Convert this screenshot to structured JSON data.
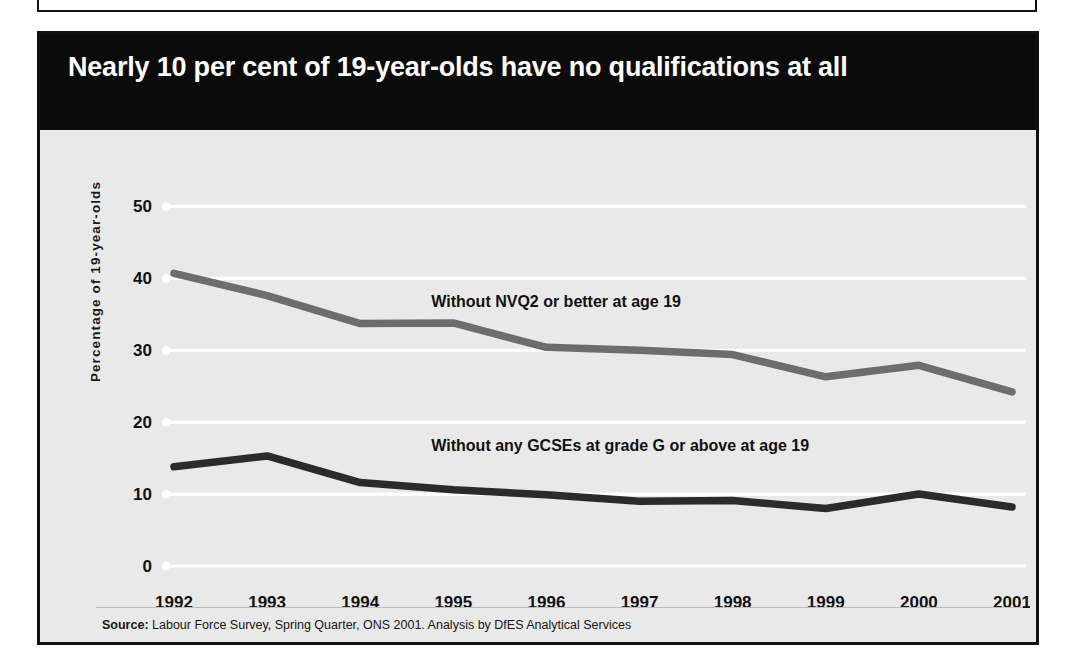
{
  "figure": {
    "title": "Nearly 10 per cent of 19-year-olds have no qualifications at all",
    "source_label": "Source:",
    "source_text": " Labour Force Survey, Spring Quarter, ONS 2001. Analysis by DfES Analytical Services",
    "colors": {
      "title_band": "#0b0b0b",
      "title_text": "#ffffff",
      "plot_background": "#e9e9e9",
      "gridline": "#ffffff",
      "series_nvq2": "#6d6d6d",
      "series_gcse": "#2b2b2b",
      "frame": "#111111"
    }
  },
  "chart_data": {
    "type": "line",
    "title": "Nearly 10 per cent of 19-year-olds have no qualifications at all",
    "xlabel": "",
    "ylabel": "Percentage of 19-year-olds",
    "x": [
      "1992",
      "1993",
      "1994",
      "1995",
      "1996",
      "1997",
      "1998",
      "1999",
      "2000",
      "2001"
    ],
    "categories": [
      "1992",
      "1993",
      "1994",
      "1995",
      "1996",
      "1997",
      "1998",
      "1999",
      "2000",
      "2001"
    ],
    "yticks": [
      0,
      10,
      20,
      30,
      40,
      50
    ],
    "ylim": [
      0,
      52
    ],
    "grid": "horizontal",
    "legend": "inline-annotations",
    "series": [
      {
        "name": "Without NVQ2 or better at age 19",
        "color": "#6d6d6d",
        "values": [
          40.7,
          37.6,
          33.7,
          33.8,
          30.4,
          30.0,
          29.4,
          26.3,
          27.9,
          24.2
        ]
      },
      {
        "name": "Without any GCSEs at grade G or above at age 19",
        "color": "#2b2b2b",
        "values": [
          13.8,
          15.3,
          11.6,
          10.6,
          9.9,
          9.0,
          9.1,
          8.0,
          10.0,
          8.2
        ]
      }
    ],
    "annotations": [
      {
        "text": "Without NVQ2 or better at age 19",
        "x": "1995",
        "y": 36
      },
      {
        "text": "Without any GCSEs at grade G or above at age 19",
        "x": "1995",
        "y": 16
      }
    ]
  }
}
